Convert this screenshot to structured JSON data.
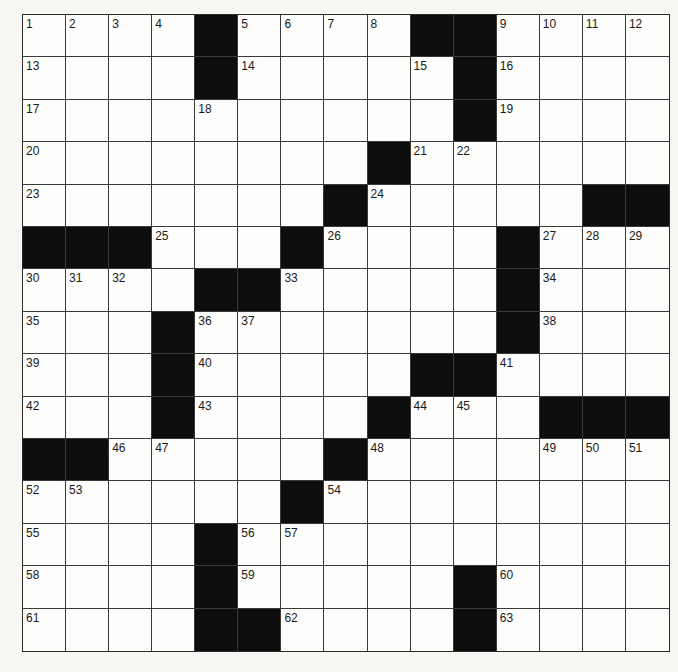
{
  "puzzle": {
    "rows": 15,
    "cols": 15,
    "colors": {
      "block": "#0d0d0d",
      "cell": "#fdfdfb",
      "line": "#3a3a3a",
      "paper": "#f7f6f3"
    },
    "grid": [
      [
        "1",
        "2",
        "3",
        "4",
        "#",
        "5",
        "6",
        "7",
        "8",
        "#",
        "#",
        "9",
        "10",
        "11",
        "12"
      ],
      [
        "13",
        ".",
        ".",
        ".",
        "#",
        "14",
        ".",
        ".",
        ".",
        "15",
        "#",
        "16",
        ".",
        ".",
        "."
      ],
      [
        "17",
        ".",
        ".",
        ".",
        "18",
        ".",
        ".",
        ".",
        ".",
        ".",
        "#",
        "19",
        ".",
        ".",
        "."
      ],
      [
        "20",
        ".",
        ".",
        ".",
        ".",
        ".",
        ".",
        ".",
        "#",
        "21",
        "22",
        ".",
        ".",
        ".",
        "."
      ],
      [
        "23",
        ".",
        ".",
        ".",
        ".",
        ".",
        ".",
        "#",
        "24",
        ".",
        ".",
        ".",
        ".",
        "#",
        "#"
      ],
      [
        "#",
        "#",
        "#",
        "25",
        ".",
        ".",
        "#",
        "26",
        ".",
        ".",
        ".",
        "#",
        "27",
        "28",
        "29"
      ],
      [
        "30",
        "31",
        "32",
        ".",
        "#",
        "#",
        "33",
        ".",
        ".",
        ".",
        ".",
        "#",
        "34",
        ".",
        "."
      ],
      [
        "35",
        ".",
        ".",
        "#",
        "36",
        "37",
        ".",
        ".",
        ".",
        ".",
        ".",
        "#",
        "38",
        ".",
        "."
      ],
      [
        "39",
        ".",
        ".",
        "#",
        "40",
        ".",
        ".",
        ".",
        ".",
        "#",
        "#",
        "41",
        ".",
        ".",
        "."
      ],
      [
        "42",
        ".",
        ".",
        "#",
        "43",
        ".",
        ".",
        ".",
        "#",
        "44",
        "45",
        ".",
        "#",
        "#",
        "#"
      ],
      [
        "#",
        "#",
        "46",
        "47",
        ".",
        ".",
        ".",
        "#",
        "48",
        ".",
        ".",
        ".",
        "49",
        "50",
        "51"
      ],
      [
        "52",
        "53",
        ".",
        ".",
        ".",
        ".",
        "#",
        "54",
        ".",
        ".",
        ".",
        ".",
        ".",
        ".",
        "."
      ],
      [
        "55",
        ".",
        ".",
        ".",
        "#",
        "56",
        "57",
        ".",
        ".",
        ".",
        ".",
        ".",
        ".",
        ".",
        "."
      ],
      [
        "58",
        ".",
        ".",
        ".",
        "#",
        "59",
        ".",
        ".",
        ".",
        ".",
        "#",
        "60",
        ".",
        ".",
        "."
      ],
      [
        "61",
        ".",
        ".",
        ".",
        "#",
        "#",
        "62",
        ".",
        ".",
        ".",
        "#",
        "63",
        ".",
        ".",
        "."
      ]
    ],
    "entries": {}
  }
}
